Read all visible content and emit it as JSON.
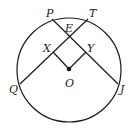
{
  "diagram": {
    "type": "geometry",
    "stroke_color": "#1a1a1a",
    "background": "#ffffff",
    "circle": {
      "center": "O",
      "cx": 69,
      "cy": 70,
      "r": 52
    },
    "points": {
      "P": {
        "label": "P",
        "x": 52,
        "y": 20
      },
      "T": {
        "label": "T",
        "x": 88,
        "y": 20
      },
      "E": {
        "label": "E",
        "x": 69,
        "y": 36
      },
      "X": {
        "label": "X",
        "x": 55,
        "y": 51
      },
      "Y": {
        "label": "Y",
        "x": 84,
        "y": 51
      },
      "O": {
        "label": "O",
        "x": 69,
        "y": 69
      },
      "Q": {
        "label": "Q",
        "x": 20,
        "y": 83
      },
      "J": {
        "label": "J",
        "x": 118,
        "y": 83
      }
    },
    "segments": [
      {
        "name": "chord-PJ",
        "from": "P",
        "to": "J"
      },
      {
        "name": "chord-TQ",
        "from": "T",
        "to": "Q"
      },
      {
        "name": "segment-OX",
        "from": "O",
        "to": "X"
      },
      {
        "name": "segment-OY",
        "from": "O",
        "to": "Y"
      }
    ]
  }
}
